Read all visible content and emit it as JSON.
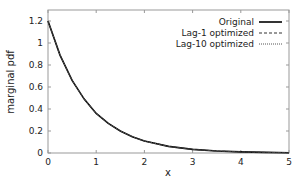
{
  "chart_data": {
    "type": "line",
    "title": "",
    "xlabel": "x",
    "ylabel": "marginal pdf",
    "xlim": [
      0,
      5
    ],
    "ylim": [
      0,
      1.3
    ],
    "xticks": [
      "0",
      "1",
      "2",
      "3",
      "4",
      "5"
    ],
    "xtick_values": [
      0,
      1,
      2,
      3,
      4,
      5
    ],
    "yticks": [
      "0",
      "0.2",
      "0.4",
      "0.6",
      "0.8",
      "1",
      "1.2"
    ],
    "ytick_values": [
      0,
      0.2,
      0.4,
      0.6,
      0.8,
      1.0,
      1.2
    ],
    "grid": false,
    "legend_position": "top-right",
    "x": [
      0,
      0.25,
      0.5,
      0.75,
      1.0,
      1.25,
      1.5,
      1.75,
      2.0,
      2.5,
      3.0,
      3.5,
      4.0,
      4.5,
      5.0
    ],
    "series": [
      {
        "name": "Original",
        "style": "solid",
        "color": "#000000",
        "values": [
          1.2,
          0.89,
          0.66,
          0.49,
          0.36,
          0.27,
          0.2,
          0.147,
          0.109,
          0.06,
          0.033,
          0.018,
          0.01,
          0.005,
          0.003
        ]
      },
      {
        "name": "Lag-1 optimized",
        "style": "dashed",
        "color": "#333333",
        "values": [
          1.2,
          0.89,
          0.66,
          0.49,
          0.36,
          0.27,
          0.2,
          0.147,
          0.109,
          0.06,
          0.033,
          0.018,
          0.01,
          0.005,
          0.003
        ]
      },
      {
        "name": "Lag-10 optimized",
        "style": "dotted",
        "color": "#555555",
        "values": [
          1.2,
          0.89,
          0.66,
          0.49,
          0.36,
          0.27,
          0.2,
          0.147,
          0.109,
          0.06,
          0.033,
          0.018,
          0.01,
          0.005,
          0.003
        ]
      }
    ]
  }
}
